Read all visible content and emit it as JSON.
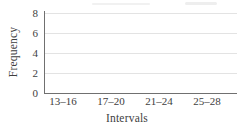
{
  "colors": {
    "background": "#ffffff",
    "text": "#3e3e3e",
    "axis": "#707070",
    "gridline": "#e3e3e3"
  },
  "chart_data": {
    "type": "bar",
    "categories": [
      "13–16",
      "17–20",
      "21–24",
      "25–28"
    ],
    "values": [
      0,
      0,
      0,
      0
    ],
    "xlabel": "Intervals",
    "ylabel": "Frequency",
    "ylim": [
      0,
      8
    ],
    "yticks": [
      8,
      6,
      4,
      2,
      0
    ],
    "grid": "horizontal",
    "legend": "none"
  }
}
